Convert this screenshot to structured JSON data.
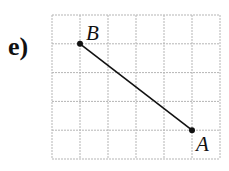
{
  "part_label": "e)",
  "grid": {
    "cols": 6,
    "rows": 5,
    "left": 52,
    "top": 15,
    "cell_w": 28,
    "cell_h": 28.8,
    "line_color": "#b5b5b5"
  },
  "points": [
    {
      "name": "B",
      "col": 1,
      "row": 1
    },
    {
      "name": "A",
      "col": 5,
      "row": 4
    }
  ],
  "segment": {
    "from": "B",
    "to": "A",
    "color": "#111111"
  }
}
